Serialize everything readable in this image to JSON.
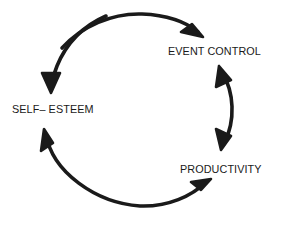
{
  "diagram": {
    "type": "cycle-diagram",
    "title": "",
    "background_color": "#ffffff",
    "stroke_color": "#1a1a1a",
    "text_color": "#1a1a1a",
    "direction": "counterclockwise",
    "nodes": [
      {
        "id": "self-esteem",
        "label": "SELF– ESTEEM",
        "position": "left"
      },
      {
        "id": "event-control",
        "label": "EVENT CONTROL",
        "position": "upper-right"
      },
      {
        "id": "productivity",
        "label": "PRODUCTIVITY",
        "position": "lower-right"
      }
    ],
    "connectors": [
      {
        "id": "self-esteem-to-event-control",
        "from": "self-esteem",
        "to": "event-control",
        "shape": "arc-top",
        "arrowheads": "single-end"
      },
      {
        "id": "event-control-to-self-esteem",
        "from": "event-control",
        "to": "self-esteem",
        "shape": "arc-upper-left",
        "arrowheads": "single-end"
      },
      {
        "id": "productivity-to-self-esteem",
        "from": "productivity",
        "to": "self-esteem",
        "shape": "arc-lower-left",
        "arrowheads": "single-end"
      },
      {
        "id": "event-control-productivity-bidirectional",
        "from": "event-control",
        "to": "productivity",
        "shape": "arc-inner-right",
        "arrowheads": "double"
      }
    ]
  }
}
